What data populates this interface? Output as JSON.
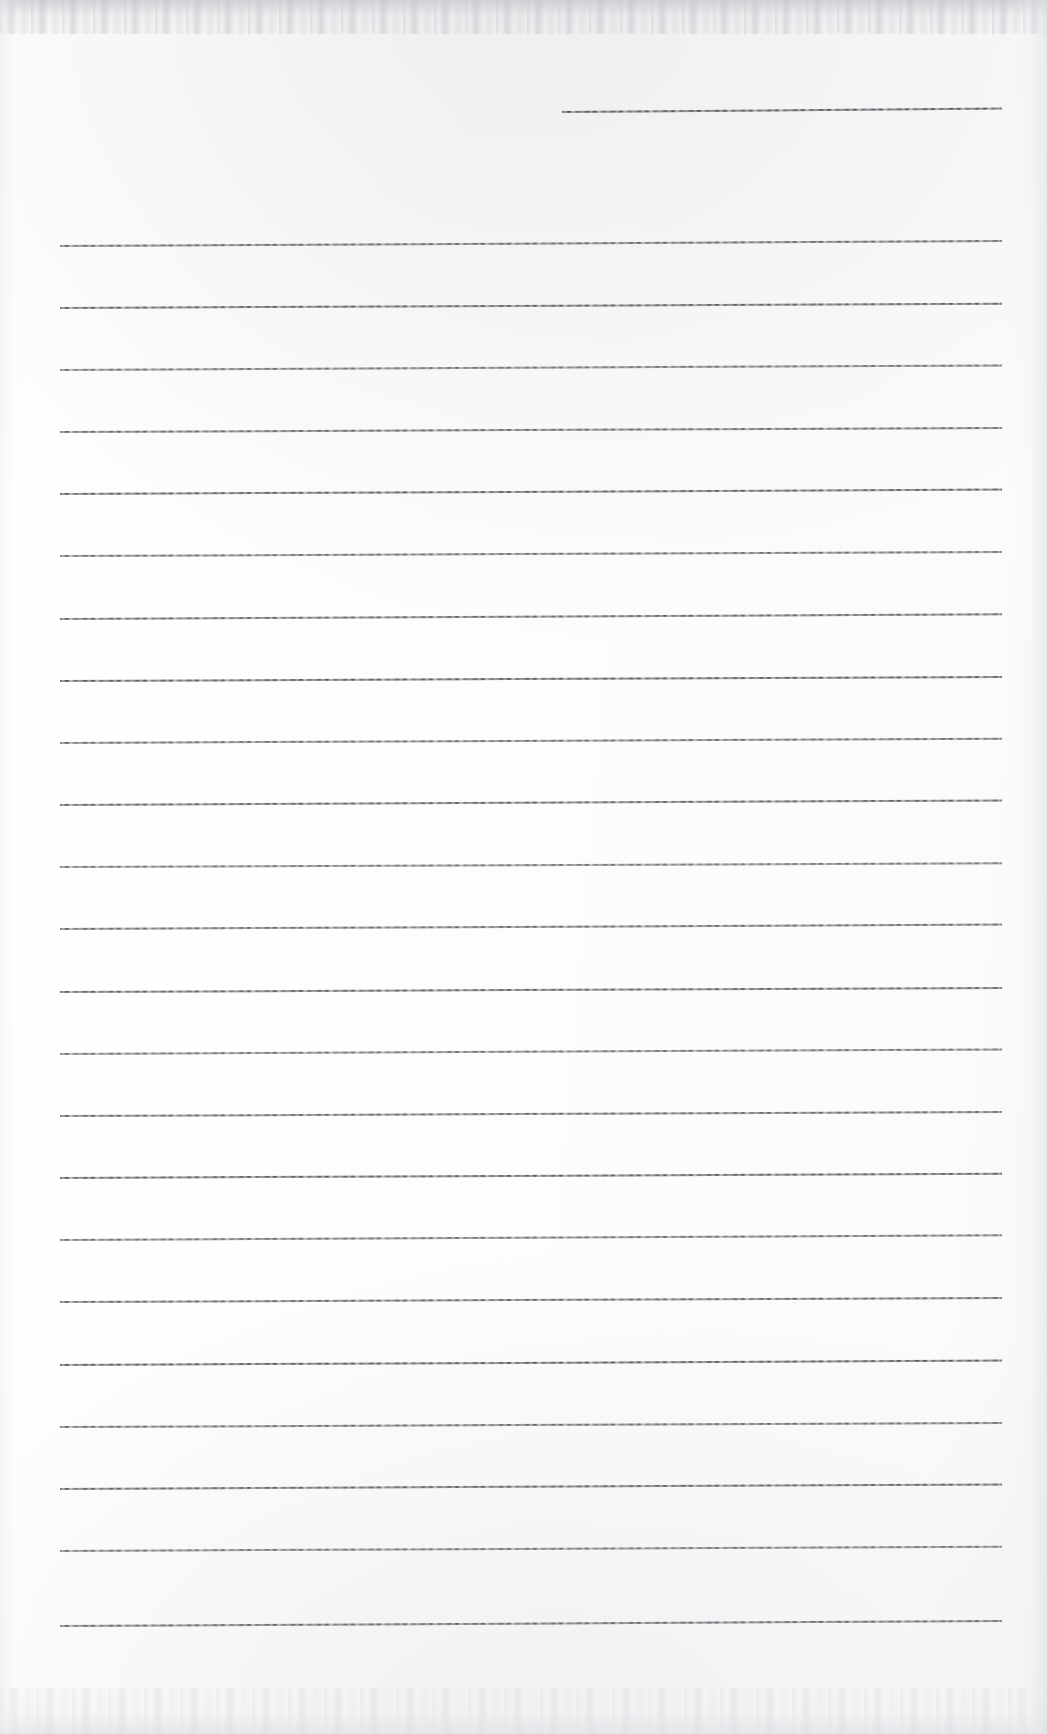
{
  "document": {
    "kind": "scanned-ruled-notebook-page",
    "title": "Blank Ruled Notebook Page",
    "page_width": 1047,
    "page_height": 1734,
    "background_color": "#fefefe",
    "rule_color": "#4e5056",
    "rule_thickness": 2,
    "content_text": "",
    "visible_text": ""
  },
  "header_rule": {
    "name": "short-top-rule",
    "x": 562,
    "y": 111,
    "width": 440,
    "tilt_deg": -0.45
  },
  "ruling": {
    "left_margin": 60,
    "right_edge": 1002,
    "line_width": 942,
    "first_line_y": 245,
    "line_spacing": 62.7,
    "line_count": 23,
    "tilt_deg": -0.26,
    "lines": [
      {
        "index": 1,
        "y": 245,
        "x": 60,
        "width": 942,
        "tilt_deg": -0.3
      },
      {
        "index": 2,
        "y": 307,
        "x": 60,
        "width": 942,
        "tilt_deg": -0.26
      },
      {
        "index": 3,
        "y": 369,
        "x": 60,
        "width": 942,
        "tilt_deg": -0.28
      },
      {
        "index": 4,
        "y": 431,
        "x": 60,
        "width": 942,
        "tilt_deg": -0.24
      },
      {
        "index": 5,
        "y": 493,
        "x": 60,
        "width": 942,
        "tilt_deg": -0.27
      },
      {
        "index": 6,
        "y": 555,
        "x": 60,
        "width": 942,
        "tilt_deg": -0.25
      },
      {
        "index": 7,
        "y": 618,
        "x": 60,
        "width": 942,
        "tilt_deg": -0.29
      },
      {
        "index": 8,
        "y": 680,
        "x": 60,
        "width": 942,
        "tilt_deg": -0.24
      },
      {
        "index": 9,
        "y": 742,
        "x": 60,
        "width": 942,
        "tilt_deg": -0.26
      },
      {
        "index": 10,
        "y": 804,
        "x": 60,
        "width": 942,
        "tilt_deg": -0.28
      },
      {
        "index": 11,
        "y": 866,
        "x": 60,
        "width": 942,
        "tilt_deg": -0.23
      },
      {
        "index": 12,
        "y": 928,
        "x": 60,
        "width": 942,
        "tilt_deg": -0.27
      },
      {
        "index": 13,
        "y": 991,
        "x": 60,
        "width": 942,
        "tilt_deg": -0.25
      },
      {
        "index": 14,
        "y": 1053,
        "x": 60,
        "width": 942,
        "tilt_deg": -0.28
      },
      {
        "index": 15,
        "y": 1115,
        "x": 60,
        "width": 942,
        "tilt_deg": -0.24
      },
      {
        "index": 16,
        "y": 1177,
        "x": 60,
        "width": 942,
        "tilt_deg": -0.26
      },
      {
        "index": 17,
        "y": 1239,
        "x": 60,
        "width": 942,
        "tilt_deg": -0.29
      },
      {
        "index": 18,
        "y": 1301,
        "x": 60,
        "width": 942,
        "tilt_deg": -0.25
      },
      {
        "index": 19,
        "y": 1364,
        "x": 60,
        "width": 942,
        "tilt_deg": -0.27
      },
      {
        "index": 20,
        "y": 1426,
        "x": 60,
        "width": 942,
        "tilt_deg": -0.24
      },
      {
        "index": 21,
        "y": 1488,
        "x": 60,
        "width": 942,
        "tilt_deg": -0.28
      },
      {
        "index": 22,
        "y": 1550,
        "x": 60,
        "width": 942,
        "tilt_deg": -0.26
      },
      {
        "index": 23,
        "y": 1625,
        "x": 60,
        "width": 942,
        "tilt_deg": -0.3
      }
    ]
  }
}
